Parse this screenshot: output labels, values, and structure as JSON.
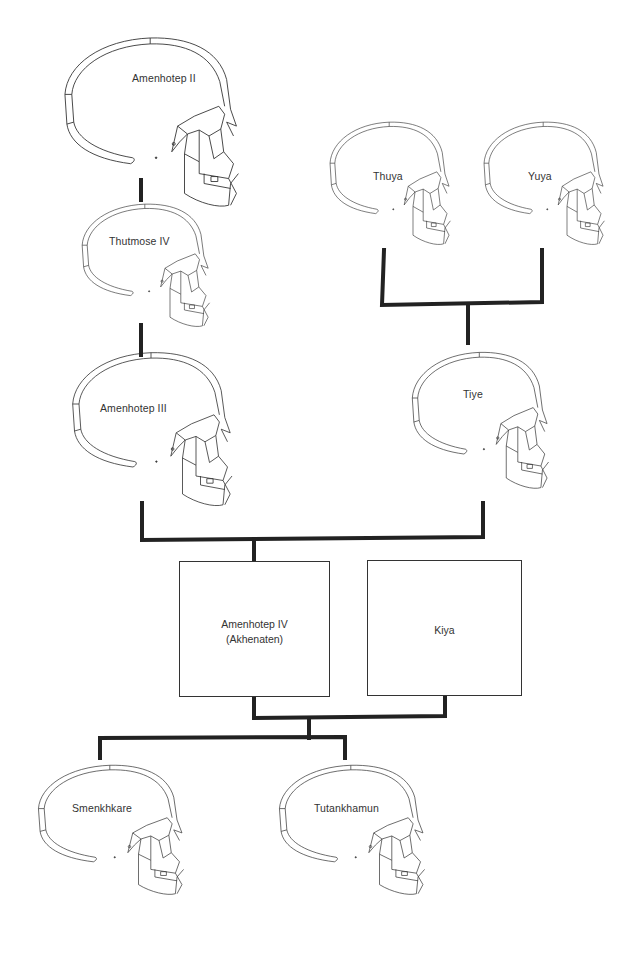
{
  "diagram": {
    "type": "family-tree",
    "title": "",
    "people": {
      "amenhotep_ii": {
        "label": "Amenhotep II"
      },
      "thutmose_iv": {
        "label": "Thutmose IV"
      },
      "amenhotep_iii": {
        "label": "Amenhotep III"
      },
      "thuya": {
        "label": "Thuya"
      },
      "yuya": {
        "label": "Yuya"
      },
      "tiye": {
        "label": "Tiye"
      },
      "akhenaten": {
        "label_line1": "Amenhotep IV",
        "label_line2": "(Akhenaten)"
      },
      "kiya": {
        "label": "Kiya"
      },
      "smenkhkare": {
        "label": "Smenkhkare"
      },
      "tutankhamun": {
        "label": "Tutankhamun"
      }
    },
    "relations": [
      {
        "from": "Amenhotep II",
        "to": "Thutmose IV",
        "type": "parent-child"
      },
      {
        "from": "Thutmose IV",
        "to": "Amenhotep III",
        "type": "parent-child"
      },
      {
        "from": [
          "Thuya",
          "Yuya"
        ],
        "to": "Tiye",
        "type": "parents-child"
      },
      {
        "from": [
          "Amenhotep III",
          "Tiye"
        ],
        "to": "Amenhotep IV (Akhenaten)",
        "type": "parents-child"
      },
      {
        "from": [
          "Amenhotep IV (Akhenaten)",
          "Kiya"
        ],
        "to": [
          "Smenkhkare",
          "Tutankhamun"
        ],
        "type": "parents-children"
      }
    ],
    "colors": {
      "line": "#222222",
      "skull_stroke": "#333333",
      "background": "#ffffff"
    }
  }
}
